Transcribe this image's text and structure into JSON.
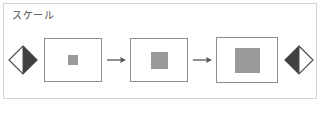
{
  "panel": {
    "title": "スケール",
    "title_icon": "none",
    "background_color": "#ffffff",
    "border_color": "#d2d2d2"
  },
  "colors": {
    "frame_border": "#8c8c8c",
    "square_fill": "#9a9a9a",
    "diamond_dark": "#404040",
    "diamond_light": "#ffffff",
    "diamond_outline": "#4a4a4a",
    "arrow": "#555555",
    "label_text": "#4a4a4a"
  },
  "handles": {
    "left": {
      "name": "scale-down-handle",
      "icon": "diamond-half-right-filled",
      "filled_side": "right"
    },
    "right": {
      "name": "scale-up-handle",
      "icon": "diamond-half-left-filled",
      "filled_side": "left"
    }
  },
  "steps": [
    {
      "index": 1,
      "label": "",
      "frame": {
        "width": 58,
        "height": 44
      },
      "square": {
        "size": 10,
        "fill": "#9a9a9a"
      }
    },
    {
      "index": 2,
      "label": "",
      "frame": {
        "width": 58,
        "height": 44
      },
      "square": {
        "size": 17,
        "fill": "#9a9a9a"
      }
    },
    {
      "index": 3,
      "label": "",
      "frame": {
        "width": 62,
        "height": 46
      },
      "square": {
        "size": 25,
        "fill": "#9a9a9a"
      }
    }
  ],
  "arrows": [
    {
      "index": 1,
      "icon": "arrow-right-icon",
      "direction": "right"
    },
    {
      "index": 2,
      "icon": "arrow-right-icon",
      "direction": "right"
    }
  ]
}
